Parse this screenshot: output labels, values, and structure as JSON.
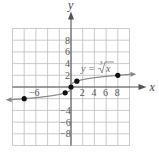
{
  "chart_data": {
    "type": "line",
    "title": "",
    "equation_label": "y = ∛ x",
    "equation_parts": {
      "lhs": "y =",
      "index": "3",
      "radicand": "x"
    },
    "xlabel": "x",
    "ylabel": "y",
    "xlim": [
      -10,
      10
    ],
    "ylim": [
      -10,
      10
    ],
    "grid": true,
    "grid_step": 2,
    "x_tick_labels": [
      "-6",
      "2",
      "4",
      "6",
      "8"
    ],
    "y_tick_labels": [
      "8",
      "6",
      "4",
      "2",
      "-4",
      "-6",
      "-8"
    ],
    "series": [
      {
        "name": "y = cube root of x",
        "function": "cbrt",
        "x": [
          -8,
          -1,
          0,
          1,
          8
        ],
        "y": [
          -2,
          -1,
          0,
          1,
          2
        ],
        "marked_points": [
          [
            -8,
            -2
          ],
          [
            -1,
            -1
          ],
          [
            0,
            0
          ],
          [
            1,
            1
          ],
          [
            8,
            2
          ]
        ]
      }
    ],
    "colors": {
      "grid": "#bdbdbd",
      "axis": "#555555",
      "curve": "#888888",
      "points": "#111111"
    }
  }
}
